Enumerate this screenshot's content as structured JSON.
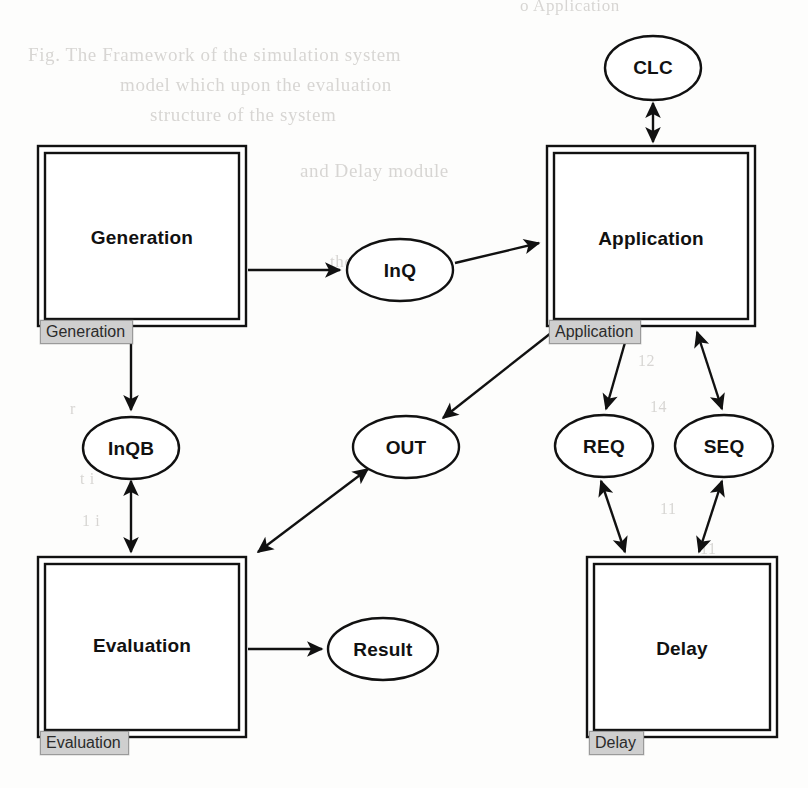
{
  "page": {
    "width": 808,
    "height": 788,
    "background_color": "#fdfdfc",
    "ink_color": "#111111",
    "tab_fill_color": "#cfcfcf",
    "bleed_color": "#b9b6b2"
  },
  "diagram": {
    "type": "block-diagram",
    "boxes": [
      {
        "id": "generation",
        "title": "Generation",
        "tab_label": "Generation",
        "x": 38,
        "y": 146,
        "w": 208,
        "h": 180
      },
      {
        "id": "application",
        "title": "Application",
        "tab_label": "Application",
        "x": 547,
        "y": 146,
        "w": 208,
        "h": 180
      },
      {
        "id": "evaluation",
        "title": "Evaluation",
        "tab_label": "Evaluation",
        "x": 38,
        "y": 557,
        "w": 208,
        "h": 180
      },
      {
        "id": "delay",
        "title": "Delay",
        "tab_label": "Delay",
        "x": 587,
        "y": 557,
        "w": 190,
        "h": 180
      }
    ],
    "ovals": [
      {
        "id": "clc",
        "title": "CLC",
        "cx": 653,
        "cy": 68,
        "rx": 48,
        "ry": 32
      },
      {
        "id": "inq",
        "title": "InQ",
        "cx": 400,
        "cy": 270,
        "rx": 53,
        "ry": 31
      },
      {
        "id": "inqb",
        "title": "InQB",
        "cx": 131,
        "cy": 448,
        "rx": 48,
        "ry": 31
      },
      {
        "id": "out",
        "title": "OUT",
        "cx": 406,
        "cy": 447,
        "rx": 53,
        "ry": 31
      },
      {
        "id": "req",
        "title": "REQ",
        "cx": 604,
        "cy": 446,
        "rx": 49,
        "ry": 31
      },
      {
        "id": "seq",
        "title": "SEQ",
        "cx": 724,
        "cy": 446,
        "rx": 49,
        "ry": 31
      },
      {
        "id": "result",
        "title": "Result",
        "cx": 383,
        "cy": 649,
        "rx": 55,
        "ry": 31
      }
    ],
    "edges": [
      {
        "id": "generation-to-inq",
        "from": "generation",
        "to": "inq",
        "direction": "forward"
      },
      {
        "id": "inq-to-application",
        "from": "inq",
        "to": "application",
        "direction": "forward"
      },
      {
        "id": "generation-to-inqb",
        "from": "generation",
        "to": "inqb",
        "direction": "forward"
      },
      {
        "id": "inqb-to-evaluation",
        "from": "inqb",
        "to": "evaluation",
        "direction": "both"
      },
      {
        "id": "clc-to-application",
        "from": "clc",
        "to": "application",
        "direction": "both"
      },
      {
        "id": "application-to-out",
        "from": "application",
        "to": "out",
        "direction": "forward"
      },
      {
        "id": "out-to-evaluation",
        "from": "out",
        "to": "evaluation",
        "direction": "both"
      },
      {
        "id": "evaluation-to-result",
        "from": "evaluation",
        "to": "result",
        "direction": "forward"
      },
      {
        "id": "application-to-req",
        "from": "application",
        "to": "req",
        "direction": "forward"
      },
      {
        "id": "seq-to-application",
        "from": "seq",
        "to": "application",
        "direction": "both"
      },
      {
        "id": "req-to-delay",
        "from": "req",
        "to": "delay",
        "direction": "both"
      },
      {
        "id": "seq-to-delay",
        "from": "seq",
        "to": "delay",
        "direction": "both"
      }
    ]
  },
  "bleed_text": {
    "note": "faint show-through text from reverse side of the scanned page",
    "lines": [
      {
        "text": "o   Application",
        "x": 520,
        "y": -4,
        "size": 17
      },
      {
        "text": "Fig.   The   Framework   of   the   simulation   system",
        "x": 28,
        "y": 44,
        "size": 19
      },
      {
        "text": "model  which  upon  the  evaluation",
        "x": 120,
        "y": 74,
        "size": 19
      },
      {
        "text": "structure  of  the   system",
        "x": 150,
        "y": 104,
        "size": 19
      },
      {
        "text": "and  Delay  module",
        "x": 300,
        "y": 160,
        "size": 19
      },
      {
        "text": "the  module",
        "x": 330,
        "y": 252,
        "size": 17
      },
      {
        "text": "a  OK",
        "x": 700,
        "y": 212,
        "size": 16
      },
      {
        "text": "11",
        "x": 702,
        "y": 262,
        "size": 16
      },
      {
        "text": "41",
        "x": 704,
        "y": 300,
        "size": 16
      },
      {
        "text": "12",
        "x": 638,
        "y": 352,
        "size": 16
      },
      {
        "text": "14",
        "x": 650,
        "y": 398,
        "size": 16
      },
      {
        "text": "11",
        "x": 660,
        "y": 500,
        "size": 16
      },
      {
        "text": "11",
        "x": 700,
        "y": 540,
        "size": 16
      },
      {
        "text": "3 2",
        "x": 690,
        "y": 580,
        "size": 16
      },
      {
        "text": "1 1",
        "x": 692,
        "y": 616,
        "size": 16
      },
      {
        "text": "o",
        "x": 708,
        "y": 652,
        "size": 16
      },
      {
        "text": "i  1",
        "x": 690,
        "y": 700,
        "size": 16
      },
      {
        "text": "t  i",
        "x": 80,
        "y": 470,
        "size": 16
      },
      {
        "text": "1  i",
        "x": 82,
        "y": 512,
        "size": 16
      },
      {
        "text": "r",
        "x": 70,
        "y": 400,
        "size": 16
      }
    ]
  }
}
